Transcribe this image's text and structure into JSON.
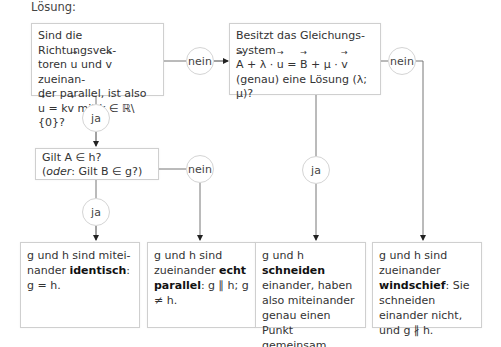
{
  "heading": "Lösung:",
  "decisions": {
    "parallel_question": {
      "line1": "Sind die Richtungsvek-",
      "line2_pre": "toren ",
      "u": "u",
      "and": " und ",
      "v": "v",
      "line2_post": " zueinan-",
      "line3": "der parallel, ist also",
      "line4_eq": " = k",
      "line4_post": " mit k ∈ ℝ\\{0}?"
    },
    "system_question": {
      "line1": "Besitzt das Gleichungs-",
      "line2": "system",
      "A": "A",
      "lambda_part": " + λ · ",
      "u": "u",
      "eq": " = ",
      "B": "B",
      "mu_part": " + μ · ",
      "v": "v",
      "line4": "(genau) eine Lösung (λ; μ)?"
    },
    "point_question": {
      "line1": "Gilt A ∈ h?",
      "line2_open": "(",
      "line2_italic": "oder",
      "line2_rest": ": Gilt B ∈ g?)"
    }
  },
  "labels": {
    "yes": "ja",
    "no": "nein"
  },
  "results": [
    {
      "pre": "g und h sind mitei-nander ",
      "bold": "identisch",
      "post": ": g = h."
    },
    {
      "pre": "g und h sind zueinander ",
      "bold": "echt parallel",
      "post": ": g ∥ h; g ≠ h."
    },
    {
      "pre": "g und h ",
      "bold": "schneiden",
      "post": " einander, haben also miteinander genau einen Punkt gemeinsam."
    },
    {
      "pre": "g und h sind zueinander ",
      "bold": "windschief",
      "post": ": Sie schneiden einander nicht, und g ∦ h."
    }
  ],
  "colors": {
    "line": "#777777",
    "border": "#cfcfcf",
    "text": "#333333"
  }
}
